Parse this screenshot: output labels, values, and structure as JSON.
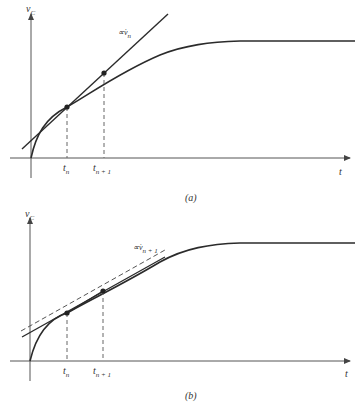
{
  "panels": [
    {
      "id": "a",
      "caption": "(a)",
      "y_axis_label": "v",
      "y_axis_sub": "C",
      "x_axis_label": "t",
      "tick_labels": [
        {
          "main": "t",
          "sub": "n"
        },
        {
          "main": "t",
          "sub": "n + 1"
        }
      ],
      "slope_label": {
        "prefix": "∝v̇",
        "sub": "n"
      }
    },
    {
      "id": "b",
      "caption": "(b)",
      "y_axis_label": "v",
      "y_axis_sub": "C",
      "x_axis_label": "t",
      "tick_labels": [
        {
          "main": "t",
          "sub": "n"
        },
        {
          "main": "t",
          "sub": "n + 1"
        }
      ],
      "slope_label": {
        "prefix": "∝v̇",
        "sub": "n + 1"
      }
    }
  ],
  "colors": {
    "line": "#2b2b2b",
    "axis": "#555555",
    "dashed": "#666666"
  }
}
